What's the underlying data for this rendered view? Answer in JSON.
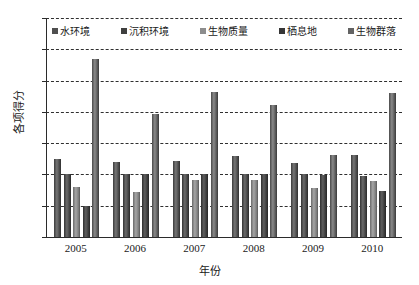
{
  "chart_data": {
    "type": "bar",
    "title": "",
    "xlabel": "年份",
    "ylabel": "各项得分",
    "categories": [
      "2005",
      "2006",
      "2007",
      "2008",
      "2009",
      "2010"
    ],
    "ylim": [
      0,
      35
    ],
    "yticks": [
      0,
      5,
      10,
      15,
      20,
      25,
      30,
      35
    ],
    "grid": "horizontal-dashed",
    "legend_position": "top-inside",
    "series": [
      {
        "name": "水环境",
        "values": [
          12.4,
          12.0,
          12.2,
          12.9,
          11.9,
          13.1
        ],
        "color": "#4f4f4f"
      },
      {
        "name": "沉积环境",
        "values": [
          10.1,
          10.0,
          10.0,
          10.0,
          10.0,
          9.8
        ],
        "color": "#3f3f3f"
      },
      {
        "name": "生物质量",
        "values": [
          8.0,
          7.2,
          9.1,
          9.1,
          7.8,
          9.0
        ],
        "color": "#8d8d8d"
      },
      {
        "name": "栖息地",
        "values": [
          5.0,
          10.0,
          10.1,
          10.0,
          9.9,
          7.3
        ],
        "color": "#363636"
      },
      {
        "name": "生物群落",
        "values": [
          28.5,
          19.6,
          23.1,
          21.1,
          13.1,
          23.0
        ],
        "color": "#636363"
      }
    ]
  },
  "axes": {
    "y_title": "各项得分",
    "x_title": "年份",
    "y_tick_labels": [
      "0",
      "5",
      "10",
      "15",
      "20",
      "25",
      "30",
      "35"
    ],
    "x_tick_labels": [
      "2005",
      "2006",
      "2007",
      "2008",
      "2009",
      "2010"
    ]
  },
  "legend": {
    "items": [
      {
        "label": "水环境"
      },
      {
        "label": "沉积环境"
      },
      {
        "label": "生物质量"
      },
      {
        "label": "栖息地"
      },
      {
        "label": "生物群落"
      }
    ]
  }
}
